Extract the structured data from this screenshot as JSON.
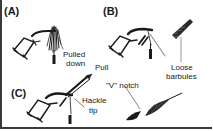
{
  "figure": {
    "panels": [
      {
        "id": "A",
        "label": "(A)",
        "annotations": [
          "Pulled",
          "down"
        ]
      },
      {
        "id": "B",
        "label": "(B)",
        "annotations": [
          "Loose",
          "barbules"
        ]
      },
      {
        "id": "C",
        "label": "(C)",
        "annotations": [
          "Pull",
          "Hackle",
          "tip",
          "\"V\" notch"
        ]
      }
    ],
    "labels": {
      "a": "(A)",
      "b": "(B)",
      "c": "(C)",
      "pulled": "Pulled",
      "down": "down",
      "pull": "Pull",
      "loose": "Loose",
      "barbules": "barbules",
      "v_notch": "\"V\" notch",
      "hackle": "Hackle",
      "tip": "tip"
    },
    "icons": [
      "fly-tying-vise-icon",
      "hackle-feather-icon",
      "hackle-pliers-icon"
    ],
    "colors": {
      "ink": "#1a1a1a",
      "frame": "#3a3a3a",
      "background": "#ffffff"
    }
  }
}
